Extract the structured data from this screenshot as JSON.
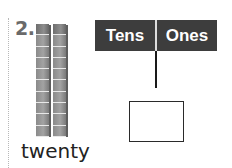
{
  "problem": {
    "number": "2.",
    "word_label": "twenty",
    "tens_rods": 2,
    "cubes_per_rod": 10
  },
  "place_value_chart": {
    "headers": [
      "Tens",
      "Ones"
    ],
    "answer_value": ""
  },
  "colors": {
    "header_bg": "#3d3d3d",
    "header_text": "#ffffff",
    "rod": "#8a8a8a"
  }
}
